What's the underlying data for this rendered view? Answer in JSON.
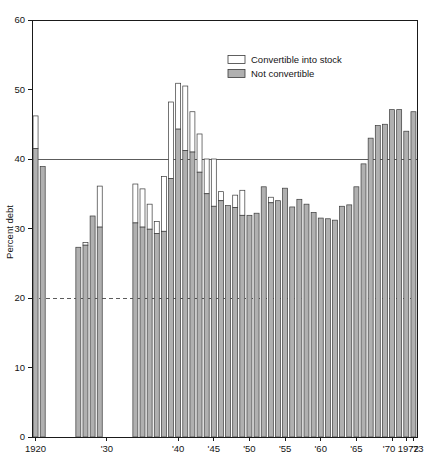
{
  "chart_data": {
    "type": "bar",
    "title": "",
    "subtitle": "",
    "xlabel": "",
    "ylabel": "Percent debt",
    "ylim": [
      0,
      60
    ],
    "yticks": [
      0,
      10,
      20,
      30,
      40,
      50,
      60
    ],
    "ytick_labels": [
      "0",
      "10",
      "20",
      "30",
      "40",
      "50",
      "60"
    ],
    "grid": "horizontal lines at 20 (dashed) and 40 (solid)",
    "gridlines": [
      {
        "value": 40,
        "style": "solid"
      },
      {
        "value": 20,
        "style": "dashed"
      }
    ],
    "legend_position": "upper center-right inside axes",
    "stacked": true,
    "series": [
      {
        "name": "Convertible into stock",
        "color": "#ffffff",
        "swatch": "white-rect"
      },
      {
        "name": "Not convertible",
        "color": "#b0b0b0",
        "swatch": "gray-rect"
      }
    ],
    "xtick_labels": [
      "1920",
      "'30",
      "'40",
      "'45",
      "'50",
      "'55",
      "'60",
      "'65",
      "'70",
      "1972",
      "'73"
    ],
    "xtick_years": [
      1920,
      1930,
      1940,
      1945,
      1950,
      1955,
      1960,
      1965,
      1970,
      1972,
      1973
    ],
    "categories": [
      1920,
      1921,
      1926,
      1927,
      1928,
      1929,
      1934,
      1935,
      1936,
      1937,
      1938,
      1939,
      1940,
      1941,
      1942,
      1943,
      1944,
      1945,
      1946,
      1947,
      1948,
      1949,
      1950,
      1951,
      1952,
      1953,
      1954,
      1955,
      1956,
      1957,
      1958,
      1959,
      1960,
      1961,
      1962,
      1963,
      1964,
      1965,
      1966,
      1967,
      1968,
      1969,
      1970,
      1971,
      1972,
      1973
    ],
    "points": [
      {
        "year": 1920,
        "not_convertible": 41.5,
        "total": 46.2
      },
      {
        "year": 1921,
        "not_convertible": 38.9,
        "total": 38.9
      },
      {
        "year": 1926,
        "not_convertible": 27.3,
        "total": 27.3
      },
      {
        "year": 1927,
        "not_convertible": 27.6,
        "total": 28.0
      },
      {
        "year": 1928,
        "not_convertible": 31.8,
        "total": 31.8
      },
      {
        "year": 1929,
        "not_convertible": 30.2,
        "total": 36.1
      },
      {
        "year": 1934,
        "not_convertible": 30.8,
        "total": 36.4
      },
      {
        "year": 1935,
        "not_convertible": 30.2,
        "total": 35.7
      },
      {
        "year": 1936,
        "not_convertible": 29.9,
        "total": 33.5
      },
      {
        "year": 1937,
        "not_convertible": 29.3,
        "total": 31.0
      },
      {
        "year": 1938,
        "not_convertible": 29.6,
        "total": 37.5
      },
      {
        "year": 1939,
        "not_convertible": 37.2,
        "total": 48.2
      },
      {
        "year": 1940,
        "not_convertible": 44.3,
        "total": 50.9
      },
      {
        "year": 1941,
        "not_convertible": 41.2,
        "total": 50.5
      },
      {
        "year": 1942,
        "not_convertible": 41.0,
        "total": 46.8
      },
      {
        "year": 1943,
        "not_convertible": 38.1,
        "total": 43.6
      },
      {
        "year": 1944,
        "not_convertible": 35.0,
        "total": 40.0
      },
      {
        "year": 1945,
        "not_convertible": 33.2,
        "total": 40.0
      },
      {
        "year": 1946,
        "not_convertible": 34.0,
        "total": 35.3
      },
      {
        "year": 1947,
        "not_convertible": 33.3,
        "total": 33.3
      },
      {
        "year": 1948,
        "not_convertible": 33.0,
        "total": 34.8
      },
      {
        "year": 1949,
        "not_convertible": 31.9,
        "total": 35.5
      },
      {
        "year": 1950,
        "not_convertible": 31.9,
        "total": 31.9
      },
      {
        "year": 1951,
        "not_convertible": 32.2,
        "total": 32.2
      },
      {
        "year": 1952,
        "not_convertible": 36.0,
        "total": 36.0
      },
      {
        "year": 1953,
        "not_convertible": 33.7,
        "total": 34.5
      },
      {
        "year": 1954,
        "not_convertible": 34.0,
        "total": 34.0
      },
      {
        "year": 1955,
        "not_convertible": 35.8,
        "total": 35.8
      },
      {
        "year": 1956,
        "not_convertible": 33.1,
        "total": 33.1
      },
      {
        "year": 1957,
        "not_convertible": 34.2,
        "total": 34.2
      },
      {
        "year": 1958,
        "not_convertible": 33.5,
        "total": 33.5
      },
      {
        "year": 1959,
        "not_convertible": 32.3,
        "total": 32.3
      },
      {
        "year": 1960,
        "not_convertible": 31.5,
        "total": 31.5
      },
      {
        "year": 1961,
        "not_convertible": 31.4,
        "total": 31.4
      },
      {
        "year": 1962,
        "not_convertible": 31.2,
        "total": 31.2
      },
      {
        "year": 1963,
        "not_convertible": 33.2,
        "total": 33.2
      },
      {
        "year": 1964,
        "not_convertible": 33.4,
        "total": 33.4
      },
      {
        "year": 1965,
        "not_convertible": 36.0,
        "total": 36.0
      },
      {
        "year": 1966,
        "not_convertible": 39.3,
        "total": 39.3
      },
      {
        "year": 1967,
        "not_convertible": 43.0,
        "total": 43.0
      },
      {
        "year": 1968,
        "not_convertible": 44.8,
        "total": 44.8
      },
      {
        "year": 1969,
        "not_convertible": 45.0,
        "total": 45.0
      },
      {
        "year": 1970,
        "not_convertible": 47.1,
        "total": 47.1
      },
      {
        "year": 1971,
        "not_convertible": 47.1,
        "total": 47.1
      },
      {
        "year": 1972,
        "not_convertible": 44.0,
        "total": 44.0
      },
      {
        "year": 1973,
        "not_convertible": 46.8,
        "total": 46.8
      }
    ]
  },
  "legend": {
    "items": [
      {
        "label": "Convertible into stock",
        "swatch": "white"
      },
      {
        "label": "Not convertible",
        "swatch": "gray"
      }
    ]
  }
}
